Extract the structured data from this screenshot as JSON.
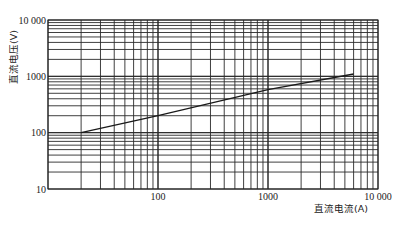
{
  "chart_data": {
    "type": "line",
    "title": "",
    "xlabel": "直流电流(A)",
    "ylabel": "直流电压(V)",
    "xscale": "log",
    "yscale": "log",
    "xlim": [
      10,
      10000
    ],
    "ylim": [
      10,
      10000
    ],
    "x_tick_labels": [
      "100",
      "1000",
      "10 000"
    ],
    "x_tick_values": [
      100,
      1000,
      10000
    ],
    "y_tick_labels": [
      "10",
      "100",
      "1000",
      "10 000"
    ],
    "y_tick_values": [
      10,
      100,
      1000,
      10000
    ],
    "grid": true,
    "legend": null,
    "series": [
      {
        "name": "voltage-current",
        "color": "#1a1a1a",
        "x": [
          20,
          100,
          1000,
          6000
        ],
        "y": [
          100,
          200,
          580,
          1100
        ]
      }
    ]
  },
  "colors": {
    "grid": "#2a2a2a",
    "line": "#1a1a1a",
    "background": "#ffffff"
  }
}
